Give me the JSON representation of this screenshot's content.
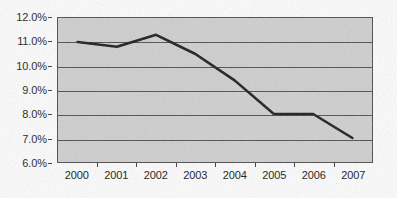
{
  "chart_data": {
    "type": "line",
    "title": "",
    "subtitle": "",
    "xlabel": "",
    "ylabel": "",
    "categories": [
      "2000",
      "2001",
      "2002",
      "2003",
      "2004",
      "2005",
      "2006",
      "2007"
    ],
    "values": [
      11.0,
      10.8,
      11.3,
      10.5,
      9.4,
      8.0,
      8.0,
      7.0
    ],
    "series": [
      {
        "name": "",
        "values": [
          11.0,
          10.8,
          11.3,
          10.5,
          9.4,
          8.0,
          8.0,
          7.0
        ]
      }
    ],
    "ylim": [
      6.0,
      12.0
    ],
    "y_ticks": [
      6.0,
      7.0,
      8.0,
      9.0,
      10.0,
      11.0,
      12.0
    ],
    "y_tick_labels": [
      "6.0%",
      "7.0%",
      "8.0%",
      "9.0%",
      "10.0%",
      "11.0%",
      "12.0%"
    ],
    "x_tick_labels": [
      "2000",
      "2001",
      "2002",
      "2003",
      "2004",
      "2005",
      "2006",
      "2007"
    ],
    "grid": true,
    "grid_axis": "y",
    "legend": false,
    "legend_position": "none",
    "annotations": []
  },
  "style": {
    "plot_background": "#cfcfcf",
    "page_background": "#fdfdfd",
    "line_color": "#1a1a1a",
    "gridline_color": "#4d4d4d",
    "axis_color": "#4a4a4a",
    "tick_label_color": "#121212"
  }
}
